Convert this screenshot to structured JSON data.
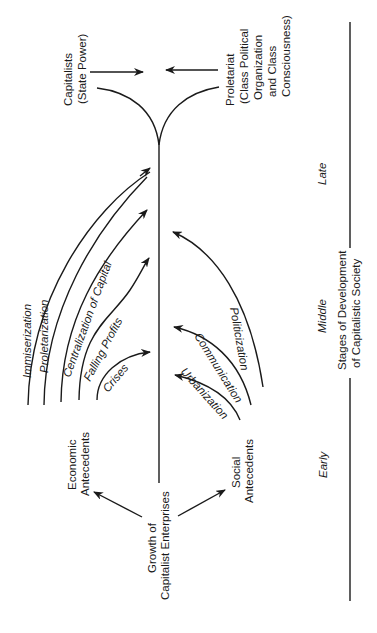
{
  "diagram": {
    "title": "Stages of Development of Capitalistic Society",
    "root": {
      "line1": "Growth of",
      "line2": "Capitalist Enterprises"
    },
    "antecedents": {
      "economic": {
        "line1": "Economic",
        "line2": "Antecedents"
      },
      "social": {
        "line1": "Social",
        "line2": "Antecedents"
      }
    },
    "economic_processes": [
      "Crises",
      "Falling Profits",
      "Centralization of Capital",
      "Proletarization",
      "Immiserization"
    ],
    "social_processes": [
      "Urbanization",
      "Communication",
      "Politicization"
    ],
    "outcomes": {
      "capitalists": {
        "line1": "Capitalists",
        "line2": "(State Power)"
      },
      "proletariat": {
        "line1": "Proletariat",
        "line2": "(Class Political",
        "line3": "Organization",
        "line4": "and Class",
        "line5": "Consciousness)"
      }
    },
    "stages": {
      "axis_label_line1": "Stages of Development",
      "axis_label_line2": "of Capitalistic Society",
      "early": "Early",
      "middle": "Middle",
      "late": "Late"
    }
  }
}
